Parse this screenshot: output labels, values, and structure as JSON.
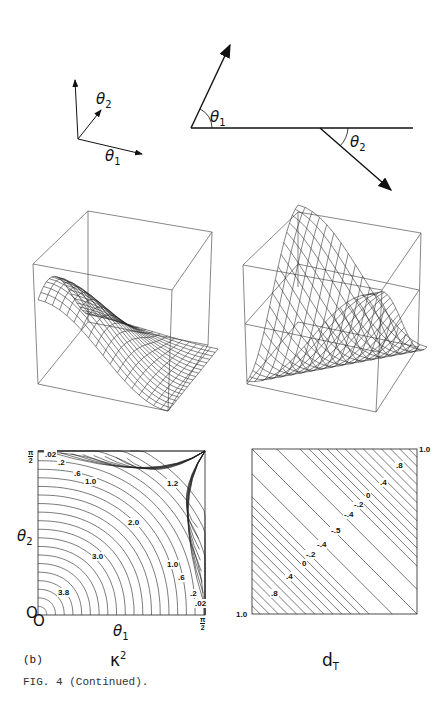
{
  "figure": {
    "caption": "FIG. 4 (Continued).",
    "panel_label": "(b)"
  },
  "diagrams": {
    "axes_sketch": {
      "theta1": "θ",
      "theta1_sub": "1",
      "theta2": "θ",
      "theta2_sub": "2"
    },
    "angle_sketch": {
      "theta1": "θ",
      "theta1_sub": "1",
      "theta2": "θ",
      "theta2_sub": "2"
    }
  },
  "surfaces": [
    {
      "name": "kappa-squared-surface",
      "type": "wireframe-3d"
    },
    {
      "name": "dT-surface",
      "type": "wireframe-3d"
    }
  ],
  "contour_left": {
    "title": "κ",
    "title_sup": "2",
    "ylabel": "θ",
    "ylabel_sub": "2",
    "xlabel": "θ",
    "xlabel_sub": "1",
    "origin_x": "O",
    "origin_y": "O",
    "pi_top": "π",
    "pi_bottom": "2",
    "xmax_top": "π",
    "xmax_bottom": "2",
    "labels": [
      {
        "text": ".02",
        "x": 44,
        "y": 455
      },
      {
        "text": ".2",
        "x": 57,
        "y": 463
      },
      {
        "text": ".6",
        "x": 73,
        "y": 474
      },
      {
        "text": "1.0",
        "x": 84,
        "y": 482
      },
      {
        "text": "1.2",
        "x": 166,
        "y": 484
      },
      {
        "text": "2.0",
        "x": 127,
        "y": 523
      },
      {
        "text": "3.0",
        "x": 91,
        "y": 557
      },
      {
        "text": "3.8",
        "x": 57,
        "y": 593
      },
      {
        "text": "1.0",
        "x": 166,
        "y": 565
      },
      {
        "text": ".6",
        "x": 177,
        "y": 578
      },
      {
        "text": ".2",
        "x": 189,
        "y": 594
      },
      {
        "text": ".02",
        "x": 194,
        "y": 604
      }
    ]
  },
  "contour_right": {
    "title": "d",
    "title_sub": "T",
    "corner_top": "1.0",
    "corner_bottom": "1.0",
    "labels": [
      {
        "text": ".8",
        "x": 395,
        "y": 466
      },
      {
        "text": ".4",
        "x": 379,
        "y": 483
      },
      {
        "text": "0",
        "x": 365,
        "y": 496
      },
      {
        "text": "-.2",
        "x": 353,
        "y": 505
      },
      {
        "text": "-.4",
        "x": 343,
        "y": 515
      },
      {
        "text": "-.5",
        "x": 330,
        "y": 531
      },
      {
        "text": "-.4",
        "x": 316,
        "y": 545
      },
      {
        "text": "-.2",
        "x": 305,
        "y": 555
      },
      {
        "text": "0",
        "x": 301,
        "y": 564
      },
      {
        "text": ".4",
        "x": 285,
        "y": 577
      },
      {
        "text": ".8",
        "x": 270,
        "y": 594
      }
    ]
  },
  "chart_data": [
    {
      "type": "heatmap",
      "title": "κ²",
      "xlabel": "θ1",
      "ylabel": "θ2",
      "xlim": [
        "0",
        "π/2"
      ],
      "ylim": [
        "0",
        "π/2"
      ],
      "contour_levels": [
        0.02,
        0.2,
        0.6,
        1.0,
        1.2,
        2.0,
        3.0,
        3.8
      ],
      "max_near": "origin (3.8)",
      "min_near": "corners (0, π/2) and (π/2, 0) (0.02)"
    },
    {
      "type": "heatmap",
      "title": "dT",
      "contour_levels": [
        0.8,
        0.4,
        0,
        -0.2,
        -0.4,
        -0.5,
        -0.4,
        -0.2,
        0,
        0.4,
        0.8
      ],
      "corner_values": {
        "top_right": 1.0,
        "bottom_left": 1.0
      },
      "minimum": -0.5,
      "note": "diagonal bands symmetric about anti-diagonal"
    }
  ]
}
